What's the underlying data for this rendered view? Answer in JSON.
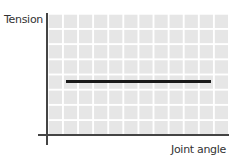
{
  "chart_data": {
    "type": "line",
    "title": "",
    "xlabel": "Joint angle",
    "ylabel": "Tension",
    "grid": true,
    "legend": null,
    "xlim": [
      0,
      12
    ],
    "ylim": [
      0,
      8
    ],
    "series": [
      {
        "name": "Tension",
        "x": [
          1,
          11
        ],
        "y": [
          3.5,
          3.5
        ],
        "color": "#1a1a1a"
      }
    ]
  },
  "labels": {
    "y_axis": "Tension",
    "x_axis": "Joint angle"
  }
}
